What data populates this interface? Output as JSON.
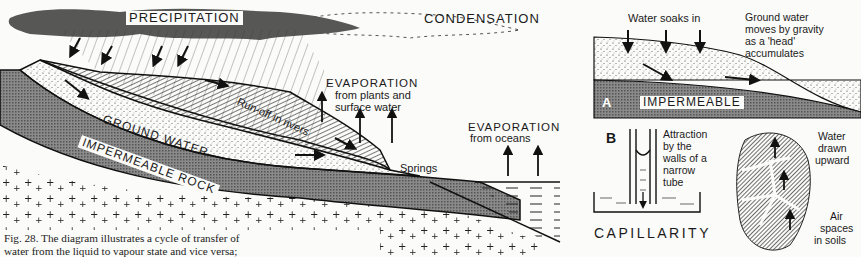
{
  "main_diagram": {
    "labels": {
      "precipitation": "PRECIPITATION",
      "condensation": "CONDENSATION",
      "run_off": "Run-off in rivers",
      "evap_plants_title": "EVAPORATION",
      "evap_plants_sub1": "from plants and",
      "evap_plants_sub2": "surface water",
      "ground_water": "GROUND WATER",
      "impermeable_rock": "IMPERMEABLE ROCK",
      "springs": "Springs",
      "evap_oceans_title": "EVAPORATION",
      "evap_oceans_sub": "from oceans"
    }
  },
  "inset_a": {
    "letter": "A",
    "water_soaks_in": "Water soaks in",
    "gw_line1": "Ground water",
    "gw_line2": "moves by gravity",
    "gw_line3": "as a 'head'",
    "gw_line4": "accumulates",
    "impermeable": "IMPERMEABLE"
  },
  "inset_b": {
    "letter": "B",
    "attr_line1": "Attraction",
    "attr_line2": "by the",
    "attr_line3": "walls of a",
    "attr_line4": "narrow",
    "attr_line5": "tube",
    "capillarity": "CAPILLARITY",
    "water_line1": "Water",
    "water_line2": "drawn",
    "water_line3": "upward",
    "air_line1": "Air",
    "air_line2": "spaces",
    "air_line3": "in soils"
  },
  "caption": {
    "line1": "Fig. 28. The diagram illustrates a cycle of transfer of",
    "line2": "water from the liquid to vapour state and vice versa;"
  }
}
